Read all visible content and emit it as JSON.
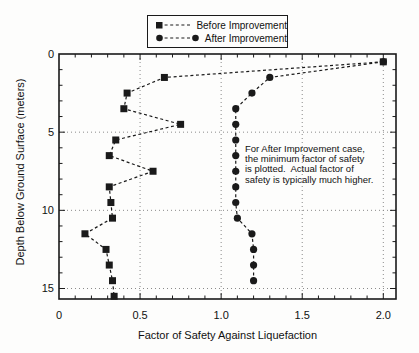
{
  "chart_data": {
    "type": "scatter",
    "title": "",
    "xlabel": "Factor of Safety Against Liquefaction",
    "ylabel": "Depth Below Ground Surface (meters)",
    "xlim": [
      0,
      2.08
    ],
    "depth_lim": [
      0,
      15.7
    ],
    "y_axis_inverted_depth_downward": true,
    "grid": "dotted",
    "legend_position": "top-center",
    "x_ticks": {
      "values": [
        0,
        0.5,
        1.0,
        1.5,
        2.0
      ],
      "labels": [
        "0",
        "0.5",
        "1.0",
        "1.5",
        "2.0"
      ]
    },
    "y_ticks": {
      "values": [
        0,
        5,
        10,
        15
      ],
      "labels": [
        "0",
        "5",
        "10",
        "15"
      ]
    },
    "x_minor_step": 0.1,
    "y_minor_step": 1,
    "x_gridlines": [
      0.5,
      1.0,
      1.5,
      2.0
    ],
    "y_gridlines": [
      5,
      10,
      15
    ],
    "series": [
      {
        "name": "Before Improvement",
        "marker": "square",
        "line": "dashed",
        "color": "#1a1a1a",
        "points_depth_fs": [
          [
            0.5,
            2.0
          ],
          [
            1.5,
            0.65
          ],
          [
            2.5,
            0.42
          ],
          [
            3.5,
            0.4
          ],
          [
            4.5,
            0.75
          ],
          [
            5.5,
            0.35
          ],
          [
            6.5,
            0.31
          ],
          [
            7.5,
            0.58
          ],
          [
            8.5,
            0.31
          ],
          [
            9.5,
            0.32
          ],
          [
            10.5,
            0.33
          ],
          [
            11.5,
            0.16
          ],
          [
            12.5,
            0.29
          ],
          [
            13.5,
            0.31
          ],
          [
            14.5,
            0.33
          ],
          [
            15.5,
            0.34
          ]
        ]
      },
      {
        "name": "After Improvement",
        "marker": "circle",
        "line": "dashed",
        "color": "#1a1a1a",
        "points_depth_fs": [
          [
            0.5,
            2.0
          ],
          [
            1.5,
            1.3
          ],
          [
            2.5,
            1.19
          ],
          [
            3.5,
            1.09
          ],
          [
            4.5,
            1.09
          ],
          [
            5.5,
            1.09
          ],
          [
            6.5,
            1.09
          ],
          [
            7.5,
            1.09
          ],
          [
            8.5,
            1.09
          ],
          [
            9.5,
            1.09
          ],
          [
            10.5,
            1.1
          ],
          [
            11.5,
            1.19
          ],
          [
            12.5,
            1.2
          ],
          [
            13.5,
            1.2
          ],
          [
            14.5,
            1.2
          ]
        ]
      }
    ]
  },
  "annotation": {
    "lines": [
      "For After Improvement case,",
      "the minimum factor of safety",
      "is plotted.  Actual factor of",
      "safety is typically much higher."
    ]
  }
}
